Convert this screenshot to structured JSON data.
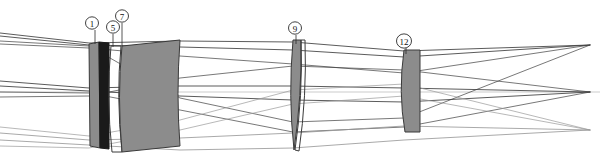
{
  "figure": {
    "kind": "optical-lens-ray-diagram",
    "width": 600,
    "height": 161,
    "background_color": "#ffffff"
  },
  "colors": {
    "glass_gray": "#8c8c8c",
    "glass_gray_stroke": "#3a3a3a",
    "glass_dark": "#1a1a1a",
    "ray_dark": "#3d3d3d",
    "ray_light": "#9a9a9a",
    "axis": "#b4b4b4",
    "callout_stroke": "#2b2b2b",
    "callout_fill": "#ffffff",
    "label_text": "#111111"
  },
  "callouts": [
    {
      "id": "callout-1",
      "label": "1",
      "cx": 92,
      "cy": 23,
      "r": 6.5,
      "leader_x": 95,
      "leader_y1": 30,
      "leader_y2": 44
    },
    {
      "id": "callout-5",
      "label": "5",
      "cx": 113,
      "cy": 27,
      "r": 6.5,
      "leader_x": 113,
      "leader_y1": 34,
      "leader_y2": 47
    },
    {
      "id": "callout-7",
      "label": "7",
      "cx": 122,
      "cy": 16,
      "r": 6.5,
      "leader_x": 122,
      "leader_y1": 23,
      "leader_y2": 46
    },
    {
      "id": "callout-9",
      "label": "9",
      "cx": 295,
      "cy": 28,
      "r": 6.5,
      "leader_x": 296,
      "leader_y1": 35,
      "leader_y2": 44
    },
    {
      "id": "callout-12",
      "label": "12",
      "cx": 404,
      "cy": 41,
      "r": 7.5,
      "leader_x": 406,
      "leader_y1": 48,
      "leader_y2": 54
    }
  ],
  "elements": [
    {
      "id": "element-1",
      "name": "front-meniscus-element",
      "label_ref": "1",
      "fill": "#8c8c8c",
      "path": "M 89 44 L 99 42 L 100 148 L 90 146 Z"
    },
    {
      "id": "element-5",
      "name": "dark-cemented-element",
      "label_ref": "5",
      "fill": "#1a1a1a",
      "path": "M 99 42 L 109 43 L 109 149 L 100 148 Z"
    },
    {
      "id": "element-7-thin-shell",
      "name": "thin-meniscus-shell",
      "label_ref": "7",
      "fill": "none",
      "path": "M 111 46 Q 106 96 112 152 L 122 152 Q 116 96 121 46 Z"
    },
    {
      "id": "element-7",
      "name": "large-thick-element",
      "label_ref": "7",
      "fill": "#8c8c8c",
      "path": "M 122 46 Q 117 96 122 152 L 180 146 Q 176 94 180 40 Z"
    },
    {
      "id": "element-9",
      "name": "biconvex-middle-element",
      "label_ref": "9",
      "fill": "#8c8c8c",
      "path": "M 293 40 Q 288 96 294 150 Q 302 96 301 40 Z"
    },
    {
      "id": "element-9-shell",
      "name": "thin-rear-shell-9",
      "label_ref": "9",
      "fill": "none",
      "path": "M 301 40 Q 303 96 295 150 L 299 151 Q 307 96 305 40 Z"
    },
    {
      "id": "element-12",
      "name": "rear-meniscus-element",
      "label_ref": "12",
      "fill": "#8c8c8c",
      "path": "M 404 50 Q 398 92 405 132 L 420 132 L 420 50 Z"
    }
  ],
  "axis": {
    "id": "optical-axis",
    "y": 92,
    "x1": 0,
    "x2": 600
  },
  "ray_bundles": [
    {
      "id": "ray-bundle-upper",
      "name": "upper-field-ray-bundle",
      "color": "#3d3d3d",
      "focus_x": 590,
      "focus_y": 45,
      "rays": [
        "M 0 33 L 89 43 L 180 41 L 293 42 L 404 51 L 590 45",
        "M 0 36 L 89 45 L 180 47 L 293 50 L 404 57 L 590 45",
        "M 0 44 L 89 48 L 180 56 L 293 64 L 404 73 L 590 45",
        "M 0 41 L 89 46 L 180 98 L 293 122 L 404 118 L 590 45"
      ]
    },
    {
      "id": "ray-bundle-middle",
      "name": "axial-ray-bundle",
      "color": "#3d3d3d",
      "focus_x": 590,
      "focus_y": 92,
      "rays": [
        "M 0 81 L 89 88 L 180 86 L 293 86 L 404 88 L 590 92",
        "M 0 86 L 89 91 L 180 96 L 293 100 L 404 102 L 590 92",
        "M 0 92 L 89 93 L 180 110 L 293 132 L 404 127 L 590 92",
        "M 0 97 L 89 96 L 180 78 L 293 66 L 404 70 L 590 92"
      ]
    },
    {
      "id": "ray-bundle-lower",
      "name": "lower-field-ray-bundle",
      "color": "#9a9a9a",
      "focus_x": 590,
      "focus_y": 130,
      "rays": [
        "M 0 133 L 89 140 L 180 138 L 293 133 L 404 126 L 590 130",
        "M 0 140 L 89 145 L 180 150 L 293 148 L 404 140 L 590 130",
        "M 0 146 L 89 148 L 180 130 L 293 104 L 404 96 L 590 130",
        "M 0 127 L 89 136 L 180 120 L 293 90 L 404 84 L 590 130"
      ]
    }
  ]
}
